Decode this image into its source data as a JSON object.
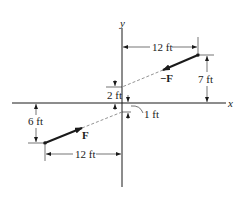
{
  "diagram": {
    "axes": {
      "x_label": "x",
      "y_label": "y"
    },
    "forces": [
      {
        "name": "F",
        "label": "F"
      },
      {
        "name": "neg-F",
        "label": "−F"
      }
    ],
    "dimensions": {
      "top_horizontal": "12 ft",
      "top_vertical": "7 ft",
      "upper_intercept": "2 ft",
      "lower_intercept": "1 ft",
      "bottom_vertical": "6 ft",
      "bottom_horizontal": "12 ft"
    },
    "colors": {
      "line": "#1a1a1a",
      "dashed": "#777777"
    }
  }
}
